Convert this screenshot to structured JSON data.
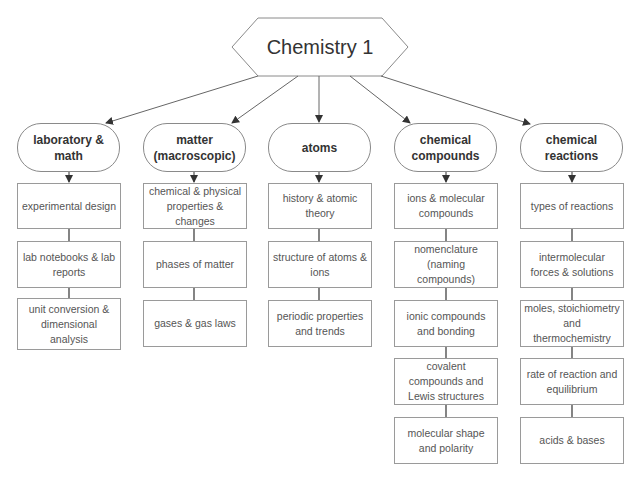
{
  "root": {
    "title": "Chemistry 1"
  },
  "columns": [
    {
      "heading": "laboratory & math",
      "items": [
        "experimental design",
        "lab notebooks & lab reports",
        "unit conversion & dimensional analysis"
      ]
    },
    {
      "heading": "matter (macroscopic)",
      "items": [
        "chemical & physical properties & changes",
        "phases of matter",
        "gases & gas laws"
      ]
    },
    {
      "heading": "atoms",
      "items": [
        "history & atomic theory",
        "structure of atoms & ions",
        "periodic properties and trends"
      ]
    },
    {
      "heading": "chemical compounds",
      "items": [
        "ions & molecular compounds",
        "nomenclature (naming compounds)",
        "ionic compounds and bonding",
        "covalent compounds and Lewis structures",
        "molecular shape and polarity"
      ]
    },
    {
      "heading": "chemical reactions",
      "items": [
        "types of reactions",
        "intermolecular forces & solutions",
        "moles, stoichiometry and thermochemistry",
        "rate of reaction and equilibrium",
        "acids & bases"
      ]
    }
  ],
  "colors": {
    "stroke": "#8a8a8a",
    "text": "#333333",
    "background": "#ffffff"
  }
}
